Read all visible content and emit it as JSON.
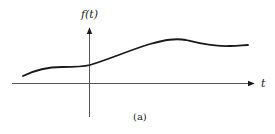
{
  "figure": {
    "y_axis_label": "f(t)",
    "x_axis_label": "t",
    "caption": "(a)",
    "colors": {
      "ink": "#1a1a1a",
      "axis": "#555555",
      "background": "#ffffff"
    },
    "curve_description": "smooth continuous signal f(t): rises from left, flattens near y-axis, increases to a peak, then decreases slightly"
  }
}
